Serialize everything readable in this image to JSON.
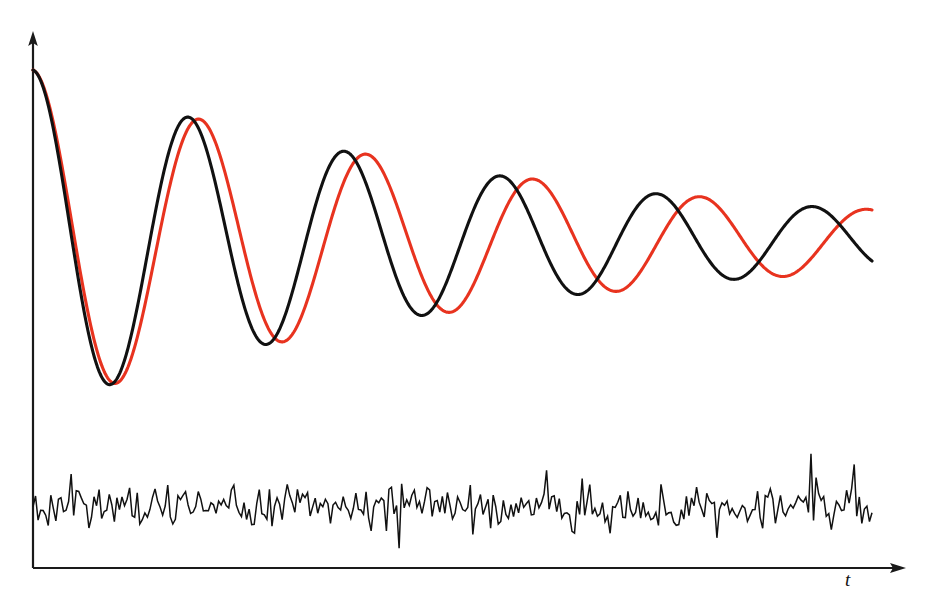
{
  "figure": {
    "width": 936,
    "height": 613,
    "background": "#ffffff"
  },
  "axes": {
    "origin_x": 33,
    "origin_y": 568,
    "y_axis_top": 33,
    "x_axis_right": 906,
    "x_label": "t",
    "y_label": "",
    "axis_color": "#1a1a1a",
    "arrows": [
      "y-up",
      "x-right"
    ],
    "ticks": "none",
    "grid": "off"
  },
  "chart_data": {
    "type": "line",
    "title": "",
    "subtitle": "",
    "xlabel": "t",
    "ylabel": "",
    "grid": false,
    "legend": "none",
    "xlim": [
      0,
      1
    ],
    "ylim": [
      -0.35,
      1.05
    ],
    "series": [
      {
        "name": "signal-black",
        "color": "#111111",
        "model": "damped-cosine",
        "amplitude": 1.0,
        "decay": 1.75,
        "period": 0.186,
        "phase": 0.0,
        "baseline": 0.0,
        "x_start": 0.0,
        "x_end": 1.0,
        "extrema": [
          {
            "type": "start",
            "x": 0.0,
            "y": 1.0
          },
          {
            "type": "min",
            "x": 0.096,
            "y": -0.607
          },
          {
            "type": "max",
            "x": 0.186,
            "y": 0.51
          },
          {
            "type": "min",
            "x": 0.286,
            "y": -0.334
          },
          {
            "type": "max",
            "x": 0.378,
            "y": 0.284
          },
          {
            "type": "min",
            "x": 0.47,
            "y": -0.186
          },
          {
            "type": "max",
            "x": 0.568,
            "y": 0.16
          },
          {
            "type": "min",
            "x": 0.662,
            "y": -0.102
          },
          {
            "type": "max",
            "x": 0.76,
            "y": 0.092
          },
          {
            "type": "min",
            "x": 0.856,
            "y": -0.056
          },
          {
            "type": "end",
            "x": 1.0,
            "y": 0.037
          }
        ]
      },
      {
        "name": "signal-red",
        "color": "#e8331f",
        "model": "damped-cosine",
        "amplitude": 1.0,
        "decay": 1.72,
        "period": 0.199,
        "phase": 0.0,
        "baseline": 0.0,
        "x_start": 0.0,
        "x_end": 1.0,
        "extrema": [
          {
            "type": "start",
            "x": 0.0,
            "y": 1.0
          },
          {
            "type": "min",
            "x": 0.101,
            "y": -0.612
          },
          {
            "type": "max",
            "x": 0.199,
            "y": 0.496
          },
          {
            "type": "min",
            "x": 0.3,
            "y": -0.33
          },
          {
            "type": "max",
            "x": 0.4,
            "y": 0.272
          },
          {
            "type": "min",
            "x": 0.5,
            "y": -0.178
          },
          {
            "type": "max",
            "x": 0.6,
            "y": 0.15
          },
          {
            "type": "min",
            "x": 0.702,
            "y": -0.098
          },
          {
            "type": "max",
            "x": 0.802,
            "y": 0.084
          },
          {
            "type": "min",
            "x": 0.903,
            "y": -0.052
          },
          {
            "type": "end",
            "x": 1.0,
            "y": 0.01
          }
        ]
      },
      {
        "name": "residual-noise",
        "color": "#111111",
        "model": "white-noise",
        "baseline": -0.233,
        "amplitude": 0.045,
        "x_start": 0.0,
        "x_end": 1.0,
        "samples": 330
      }
    ]
  },
  "rendering": {
    "noise_center_y": 508,
    "noise_amplitude_px": 19,
    "curve_start_y": 70,
    "curve_end_y": 240,
    "curve_start_x": 33,
    "curve_end_x": 872
  }
}
